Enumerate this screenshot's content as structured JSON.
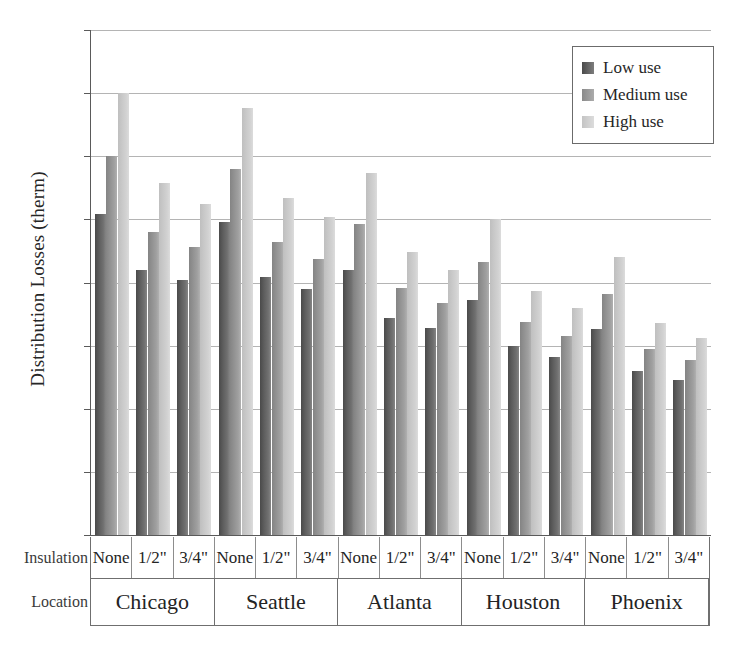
{
  "chart_data": {
    "type": "bar",
    "title": "",
    "xlabel": "",
    "ylabel": "Distribution Losses (therm)",
    "ylim": [
      0,
      40
    ],
    "yticks": [
      0,
      5,
      10,
      15,
      20,
      25,
      30,
      35,
      40
    ],
    "grid": true,
    "legend_position": "top-right",
    "legend": [
      "Low use",
      "Medium use",
      "High use"
    ],
    "group_axis_labels": [
      "Insulation",
      "Location"
    ],
    "locations": [
      "Chicago",
      "Seattle",
      "Atlanta",
      "Houston",
      "Phoenix"
    ],
    "insulation_levels": [
      "None",
      "1/2\"",
      "3/4\""
    ],
    "categories": [
      "Chicago None",
      "Chicago 1/2\"",
      "Chicago 3/4\"",
      "Seattle None",
      "Seattle 1/2\"",
      "Seattle 3/4\"",
      "Atlanta None",
      "Atlanta 1/2\"",
      "Atlanta 3/4\"",
      "Houston None",
      "Houston 1/2\"",
      "Houston 3/4\"",
      "Phoenix None",
      "Phoenix 1/2\"",
      "Phoenix 3/4\""
    ],
    "series": [
      {
        "name": "Low use",
        "color": "#5d5d5d",
        "values": [
          25.4,
          21.0,
          20.2,
          24.8,
          20.4,
          19.5,
          21.0,
          17.2,
          16.4,
          18.6,
          15.0,
          14.1,
          16.3,
          13.0,
          12.3
        ]
      },
      {
        "name": "Medium use",
        "color": "#949494",
        "values": [
          30.0,
          24.0,
          22.8,
          29.0,
          23.2,
          21.9,
          24.6,
          19.6,
          18.4,
          21.6,
          16.9,
          15.8,
          19.1,
          14.7,
          13.9
        ]
      },
      {
        "name": "High use",
        "color": "#cdcdcd",
        "values": [
          35.0,
          27.9,
          26.2,
          33.8,
          26.7,
          25.2,
          28.7,
          22.4,
          21.0,
          25.0,
          19.3,
          18.0,
          22.0,
          16.8,
          15.6
        ]
      }
    ]
  },
  "axis": {
    "y_title": "Distribution Losses (therm)",
    "tick_labels": [
      "40",
      "35",
      "30",
      "25",
      "20",
      "15",
      "10",
      "5",
      "0"
    ]
  },
  "row_headers": {
    "insulation": "Insulation",
    "location": "Location"
  },
  "legend": {
    "items": [
      {
        "label": "Low use",
        "key": "low"
      },
      {
        "label": "Medium use",
        "key": "medium"
      },
      {
        "label": "High use",
        "key": "high"
      }
    ]
  },
  "colors": {
    "low_use": "#5d5d5d",
    "medium_use": "#949494",
    "high_use": "#cdcdcd",
    "axis": "#5a5a5a",
    "gridline": "#b4b4b4",
    "text": "#262626"
  }
}
